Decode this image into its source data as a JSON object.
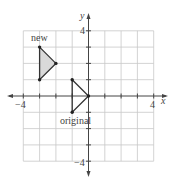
{
  "diagram": {
    "type": "coordinate-plane-transformation",
    "axes": {
      "x_label": "x",
      "y_label": "y",
      "x_tick_labels": [
        "−4",
        "4"
      ],
      "y_tick_labels": [
        "4",
        "−4"
      ],
      "range": [
        -5,
        5
      ],
      "grid_step": 1
    },
    "shapes": [
      {
        "name": "new",
        "label": "new",
        "vertices": [
          [
            -3,
            3
          ],
          [
            -2,
            2
          ],
          [
            -3,
            1
          ]
        ],
        "fill": "#d9d9d9",
        "stroke": "#333333"
      },
      {
        "name": "original",
        "label": "original",
        "vertices": [
          [
            -1,
            1
          ],
          [
            0,
            0
          ],
          [
            -1,
            -1
          ]
        ],
        "fill": "none",
        "stroke": "#333333"
      }
    ]
  }
}
